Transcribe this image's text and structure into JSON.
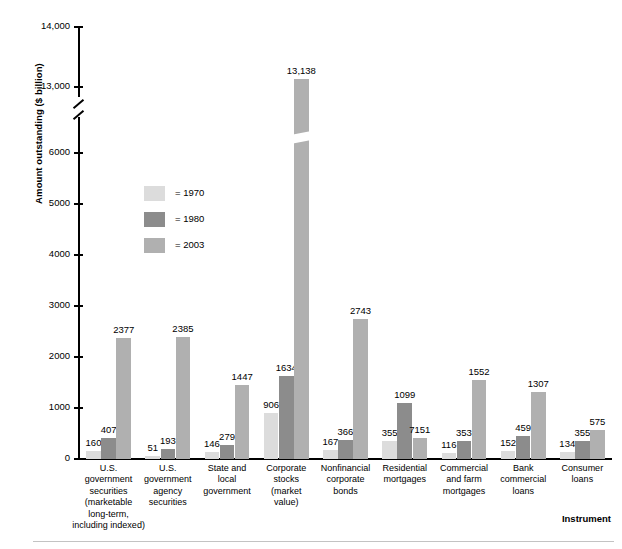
{
  "figure": {
    "top_caption": "",
    "x_axis_title": "Instrument",
    "y_axis_title": "Amount outstanding ($ billion)"
  },
  "legend": {
    "position": "inside-left",
    "entries": [
      {
        "label": "= 1970",
        "year": "1970",
        "color": "#dcdcdc"
      },
      {
        "label": "= 1980",
        "year": "1980",
        "color": "#8c8c8c"
      },
      {
        "label": "= 2003",
        "year": "2003",
        "color": "#b0b0b0"
      }
    ]
  },
  "y_ticks": [
    {
      "label": "14,000",
      "value": 14000
    },
    {
      "label": "13,000",
      "value": 13000
    },
    {
      "label": "6000",
      "value": 6000
    },
    {
      "label": "5000",
      "value": 5000
    },
    {
      "label": "4000",
      "value": 4000
    },
    {
      "label": "3000",
      "value": 3000
    },
    {
      "label": "2000",
      "value": 2000
    },
    {
      "label": "1000",
      "value": 1000
    },
    {
      "label": "0",
      "value": 0
    }
  ],
  "chart_data": {
    "type": "bar",
    "title": "",
    "xlabel": "Instrument",
    "ylabel": "Amount outstanding ($ billion)",
    "ylim": [
      0,
      14000
    ],
    "axis_break": {
      "from": 6000,
      "to": 13000
    },
    "grid": false,
    "legend_position": "inside-left",
    "categories": [
      "U.S. government securities (marketable long-term, including indexed)",
      "U.S. government agency securities",
      "State and local government",
      "Corporate stocks (market value)",
      "Nonfinancial corporate bonds",
      "Residential mortgages",
      "Commercial and farm mortgages",
      "Bank commercial loans",
      "Consumer loans"
    ],
    "category_lines": [
      [
        "U.S.",
        "government",
        "securities",
        "(marketable",
        "long-term,",
        "including indexed)"
      ],
      [
        "U.S.",
        "government",
        "agency",
        "securities"
      ],
      [
        "State and",
        "local",
        "government"
      ],
      [
        "Corporate",
        "stocks",
        "(market",
        "value)"
      ],
      [
        "Nonfinancial",
        "corporate",
        "bonds"
      ],
      [
        "Residential",
        "mortgages"
      ],
      [
        "Commercial",
        "and farm",
        "mortgages"
      ],
      [
        "Bank",
        "commercial",
        "loans"
      ],
      [
        "Consumer",
        "loans"
      ]
    ],
    "series": [
      {
        "name": "1970",
        "color": "#dcdcdc",
        "values": [
          160,
          51,
          146,
          906,
          167,
          355,
          116,
          152,
          134
        ]
      },
      {
        "name": "1980",
        "color": "#8c8c8c",
        "values": [
          407,
          193,
          279,
          1634,
          366,
          1099,
          353,
          459,
          355
        ]
      },
      {
        "name": "2003",
        "color": "#b0b0b0",
        "values": [
          2377,
          2385,
          1447,
          13138,
          2743,
          7151,
          1552,
          1307,
          575
        ]
      }
    ],
    "value_labels": [
      [
        "160",
        "407",
        "2377"
      ],
      [
        "51",
        "193",
        "2385"
      ],
      [
        "146",
        "279",
        "1447"
      ],
      [
        "906",
        "1634",
        "13,138"
      ],
      [
        "167",
        "366",
        "2743"
      ],
      [
        "355",
        "1099",
        "7151"
      ],
      [
        "116",
        "353",
        "1552"
      ],
      [
        "152",
        "459",
        "1307"
      ],
      [
        "134",
        "355",
        "575"
      ]
    ]
  }
}
